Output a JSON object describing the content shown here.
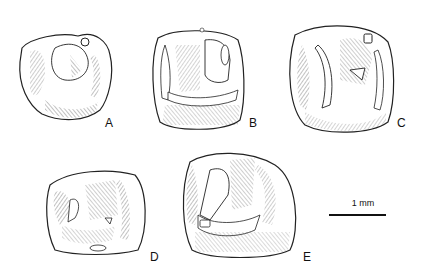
{
  "figure": {
    "specimens": [
      {
        "id": "A",
        "label": "A",
        "description": "tooth occlusal view"
      },
      {
        "id": "B",
        "label": "B",
        "description": "tooth occlusal view"
      },
      {
        "id": "C",
        "label": "C",
        "description": "tooth occlusal view"
      },
      {
        "id": "D",
        "label": "D",
        "description": "tooth occlusal view"
      },
      {
        "id": "E",
        "label": "E",
        "description": "tooth occlusal view"
      }
    ],
    "scale_bar": {
      "label": "1 mm"
    },
    "colors": {
      "ink": "#111111",
      "background": "#ffffff"
    }
  }
}
